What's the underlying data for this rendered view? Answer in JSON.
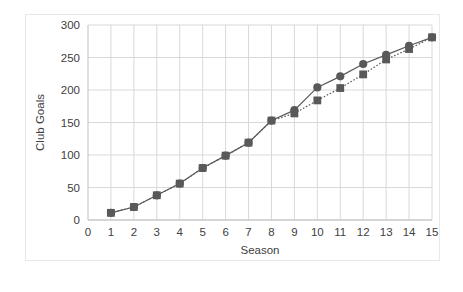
{
  "chart_data": {
    "type": "line",
    "title": "",
    "xlabel": "Season",
    "ylabel": "Club Goals",
    "x": [
      1,
      2,
      3,
      4,
      5,
      6,
      7,
      8,
      9,
      10,
      11,
      12,
      13,
      14,
      15
    ],
    "xlim": [
      0,
      15
    ],
    "ylim": [
      0,
      300
    ],
    "xticks": [
      0,
      1,
      2,
      3,
      4,
      5,
      6,
      7,
      8,
      9,
      10,
      11,
      12,
      13,
      14,
      15
    ],
    "yticks": [
      0,
      50,
      100,
      150,
      200,
      250,
      300
    ],
    "xtick_labels": [
      "0",
      "1",
      "2",
      "3",
      "4",
      "5",
      "6",
      "7",
      "8",
      "9",
      "10",
      "11",
      "12",
      "13",
      "14",
      "15"
    ],
    "ytick_labels": [
      "0",
      "50",
      "100",
      "150",
      "200",
      "250",
      "300"
    ],
    "grid": "horizontal-and-vertical",
    "legend": "none",
    "series": [
      {
        "name": "series-circles",
        "marker": "circle",
        "linestyle": "solid",
        "color": "#595959",
        "values": [
          11,
          20,
          38,
          56,
          80,
          99,
          119,
          153,
          169,
          204,
          221,
          240,
          254,
          268,
          281
        ]
      },
      {
        "name": "series-squares",
        "marker": "square",
        "linestyle": "dotted",
        "color": "#595959",
        "values": [
          11,
          20,
          38,
          56,
          80,
          99,
          119,
          153,
          164,
          184,
          203,
          224,
          247,
          263,
          281
        ]
      }
    ],
    "colors": {
      "marker": "#595959",
      "line": "#595959",
      "grid": "#d9d9d9",
      "axis": "#bfbfbf",
      "text": "#404040",
      "background": "#ffffff",
      "frame": "#e8e8e8"
    }
  }
}
